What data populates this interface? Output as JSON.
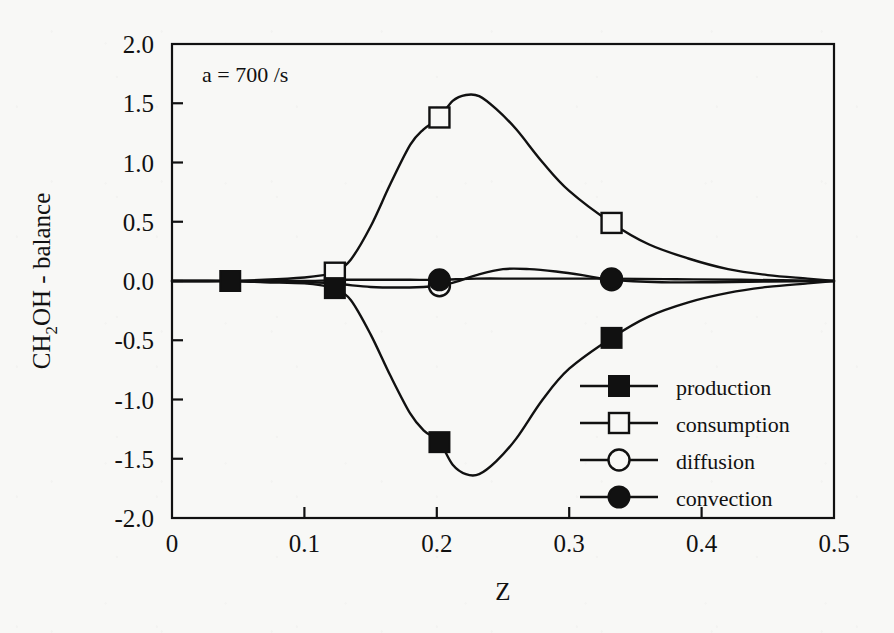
{
  "figure": {
    "annotation": "a = 700 /s",
    "background_color": "#f8f8f6",
    "ink_color": "#111111"
  },
  "chart_data": {
    "type": "line",
    "title": "",
    "subtitle": "",
    "annotation": "a = 700 /s",
    "xlabel": "Z",
    "ylabel": "CH2OH - balance",
    "ylabel_parts": {
      "pre": "CH",
      "sub": "2",
      "post": "OH - balance"
    },
    "xlim": [
      0,
      0.5
    ],
    "ylim": [
      -2.0,
      2.0
    ],
    "xticks": [
      0,
      0.1,
      0.2,
      0.3,
      0.4,
      0.5
    ],
    "xticklabels": [
      "0",
      "0.1",
      "0.2",
      "0.3",
      "0.4",
      "0.5"
    ],
    "yticks": [
      2.0,
      1.5,
      1.0,
      0.5,
      0.0,
      -0.5,
      -1.0,
      -1.5,
      -2.0
    ],
    "yticklabels": [
      "2.0",
      "1.5",
      "1.0",
      "0.5",
      "0.0",
      "-0.5",
      "-1.0",
      "-1.5",
      "-2.0"
    ],
    "grid": false,
    "legend_position": "lower-right-inside",
    "tick_direction": "in",
    "series": [
      {
        "name": "production",
        "marker": "filled-square",
        "line": "solid",
        "marker_points": [
          {
            "x": 0.044,
            "y": 0.0
          },
          {
            "x": 0.123,
            "y": -0.06
          },
          {
            "x": 0.202,
            "y": -1.36
          },
          {
            "x": 0.332,
            "y": -0.48
          }
        ],
        "x": [
          0.0,
          0.02,
          0.044,
          0.07,
          0.1,
          0.115,
          0.123,
          0.135,
          0.15,
          0.165,
          0.18,
          0.19,
          0.202,
          0.212,
          0.222,
          0.232,
          0.245,
          0.26,
          0.28,
          0.3,
          0.332,
          0.36,
          0.39,
          0.42,
          0.45,
          0.48,
          0.5
        ],
        "y": [
          0.0,
          0.0,
          0.0,
          -0.01,
          -0.02,
          -0.04,
          -0.06,
          -0.16,
          -0.45,
          -0.8,
          -1.12,
          -1.26,
          -1.36,
          -1.55,
          -1.63,
          -1.63,
          -1.52,
          -1.33,
          -1.0,
          -0.74,
          -0.48,
          -0.3,
          -0.18,
          -0.1,
          -0.05,
          -0.02,
          0.0
        ]
      },
      {
        "name": "consumption",
        "marker": "open-square",
        "line": "solid",
        "marker_points": [
          {
            "x": 0.123,
            "y": 0.07
          },
          {
            "x": 0.202,
            "y": 1.38
          },
          {
            "x": 0.332,
            "y": 0.49
          }
        ],
        "x": [
          0.0,
          0.02,
          0.044,
          0.07,
          0.1,
          0.115,
          0.123,
          0.135,
          0.15,
          0.165,
          0.18,
          0.19,
          0.202,
          0.212,
          0.222,
          0.232,
          0.245,
          0.26,
          0.28,
          0.3,
          0.332,
          0.36,
          0.39,
          0.42,
          0.45,
          0.48,
          0.5
        ],
        "y": [
          0.0,
          0.0,
          0.0,
          0.01,
          0.03,
          0.05,
          0.07,
          0.18,
          0.46,
          0.82,
          1.15,
          1.28,
          1.38,
          1.52,
          1.57,
          1.56,
          1.45,
          1.28,
          1.0,
          0.76,
          0.49,
          0.31,
          0.19,
          0.1,
          0.05,
          0.02,
          0.0
        ]
      },
      {
        "name": "diffusion",
        "marker": "open-circle",
        "line": "solid",
        "marker_points": [
          {
            "x": 0.202,
            "y": -0.04
          },
          {
            "x": 0.332,
            "y": 0.01
          }
        ],
        "x": [
          0.0,
          0.04,
          0.08,
          0.115,
          0.13,
          0.15,
          0.17,
          0.19,
          0.202,
          0.215,
          0.23,
          0.25,
          0.27,
          0.29,
          0.31,
          0.332,
          0.37,
          0.41,
          0.45,
          0.5
        ],
        "y": [
          0.0,
          0.0,
          -0.005,
          -0.015,
          -0.03,
          -0.05,
          -0.055,
          -0.05,
          -0.04,
          -0.005,
          0.05,
          0.1,
          0.1,
          0.08,
          0.05,
          0.01,
          -0.01,
          -0.01,
          -0.005,
          0.0
        ]
      },
      {
        "name": "convection",
        "marker": "filled-circle",
        "line": "solid",
        "marker_points": [
          {
            "x": 0.202,
            "y": 0.01
          },
          {
            "x": 0.332,
            "y": 0.02
          }
        ],
        "x": [
          0.0,
          0.05,
          0.1,
          0.13,
          0.16,
          0.18,
          0.202,
          0.23,
          0.26,
          0.29,
          0.332,
          0.38,
          0.43,
          0.5
        ],
        "y": [
          0.0,
          0.0,
          0.0,
          0.01,
          0.01,
          0.01,
          0.01,
          0.02,
          0.02,
          0.02,
          0.02,
          0.015,
          0.01,
          0.0
        ]
      }
    ],
    "legend": [
      {
        "label": "production",
        "marker": "filled-square"
      },
      {
        "label": "consumption",
        "marker": "open-square"
      },
      {
        "label": "diffusion",
        "marker": "open-circle"
      },
      {
        "label": "convection",
        "marker": "filled-circle"
      }
    ]
  }
}
